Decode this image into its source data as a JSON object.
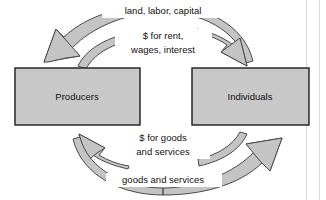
{
  "diagram": {
    "type": "circular-flow",
    "entities": [
      {
        "id": "producers",
        "label": "Producers"
      },
      {
        "id": "individuals",
        "label": "Individuals"
      }
    ],
    "flows": [
      {
        "id": "resources",
        "label_lines": [
          "land, labor, capital"
        ],
        "from": "individuals",
        "to": "producers",
        "position": "outer-top"
      },
      {
        "id": "factor-payments",
        "label_lines": [
          "$ for rent,",
          "wages, interest"
        ],
        "from": "producers",
        "to": "individuals",
        "position": "inner-top"
      },
      {
        "id": "consumer-spending",
        "label_lines": [
          "$ for goods",
          "and services"
        ],
        "from": "individuals",
        "to": "producers",
        "position": "inner-bottom"
      },
      {
        "id": "goods-services",
        "label_lines": [
          "goods and services"
        ],
        "from": "producers",
        "to": "individuals",
        "position": "outer-bottom"
      }
    ],
    "colors": {
      "box_fill": "#c8c8c8",
      "box_stroke": "#1c1c1c",
      "arrow_fill": "#c4c4c4",
      "arrow_stroke": "#4a4a4a",
      "text": "#111111",
      "background": "#ffffff"
    }
  }
}
